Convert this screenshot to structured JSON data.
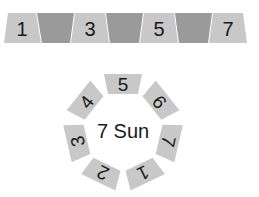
{
  "strip": {
    "colors": {
      "light": "#c8c8c8",
      "dark": "#9a9a9a",
      "gap": "#ffffff"
    },
    "cells": [
      {
        "label": "1",
        "shade": "light"
      },
      {
        "label": "",
        "shade": "dark"
      },
      {
        "label": "3",
        "shade": "light"
      },
      {
        "label": "",
        "shade": "dark"
      },
      {
        "label": "5",
        "shade": "light"
      },
      {
        "label": "",
        "shade": "dark"
      },
      {
        "label": "7",
        "shade": "light"
      }
    ]
  },
  "ring": {
    "center_label": "7 Sun",
    "tile_color": "#c8c8c8",
    "tiles": [
      {
        "label": "5",
        "angle": 0
      },
      {
        "label": "6",
        "angle": 51.4
      },
      {
        "label": "7",
        "angle": 102.9
      },
      {
        "label": "1",
        "angle": 154.3
      },
      {
        "label": "2",
        "angle": 205.7
      },
      {
        "label": "3",
        "angle": 257.1
      },
      {
        "label": "4",
        "angle": 308.6
      }
    ]
  }
}
